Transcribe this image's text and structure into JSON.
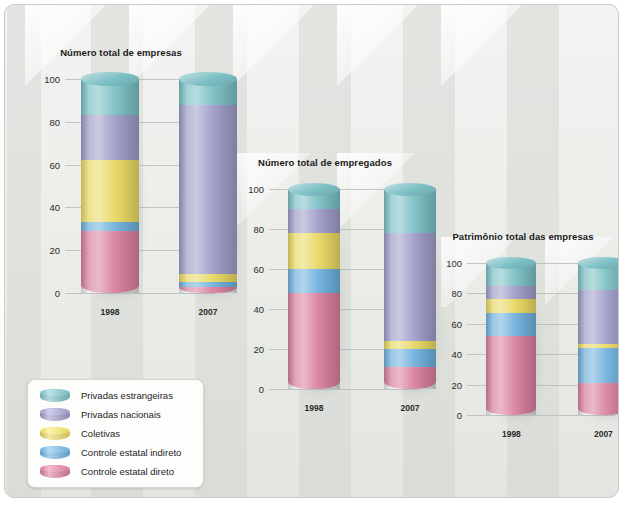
{
  "figure": {
    "background_color": "#ecEEea",
    "frame_color": "#c9cbc8"
  },
  "legend": {
    "items": [
      {
        "label": "Privadas estrangeiras",
        "key": "privadas_estrangeiras",
        "color": "#7bbfc4"
      },
      {
        "label": "Privadas nacionais",
        "key": "privadas_nacionais",
        "color": "#9e9cc8"
      },
      {
        "label": "Coletivas",
        "key": "coletivas",
        "color": "#e8d862"
      },
      {
        "label": "Controle estatal indireto",
        "key": "controle_estatal_indireto",
        "color": "#6fb0dc"
      },
      {
        "label": "Controle estatal direto",
        "key": "controle_estatal_direto",
        "color": "#d87f9f"
      }
    ]
  },
  "chart_data": [
    {
      "id": "empresas",
      "type": "bar",
      "stacked": true,
      "title": "Número total de empresas",
      "xlabel": "",
      "ylabel": "",
      "categories": [
        "1998",
        "2007"
      ],
      "yticks": [
        0,
        20,
        40,
        60,
        80,
        100
      ],
      "ylim": [
        0,
        100
      ],
      "grid": true,
      "legend_position": "bottom-left-external",
      "unit": "%",
      "series": [
        {
          "name": "Controle estatal direto",
          "color": "#d87f9f",
          "values": [
            29,
            3
          ]
        },
        {
          "name": "Controle estatal indireto",
          "color": "#6fb0dc",
          "values": [
            4,
            2
          ]
        },
        {
          "name": "Coletivas",
          "color": "#e8d862",
          "values": [
            29,
            4
          ]
        },
        {
          "name": "Privadas nacionais",
          "color": "#9e9cc8",
          "values": [
            21,
            79
          ]
        },
        {
          "name": "Privadas estrangeiras",
          "color": "#7bbfc4",
          "values": [
            17,
            12
          ]
        }
      ]
    },
    {
      "id": "empregados",
      "type": "bar",
      "stacked": true,
      "title": "Número total de empregados",
      "xlabel": "",
      "ylabel": "",
      "categories": [
        "1998",
        "2007"
      ],
      "yticks": [
        0,
        20,
        40,
        60,
        80,
        100
      ],
      "ylim": [
        0,
        100
      ],
      "grid": true,
      "unit": "%",
      "series": [
        {
          "name": "Controle estatal direto",
          "color": "#d87f9f",
          "values": [
            48,
            11
          ]
        },
        {
          "name": "Controle estatal indireto",
          "color": "#6fb0dc",
          "values": [
            12,
            9
          ]
        },
        {
          "name": "Coletivas",
          "color": "#e8d862",
          "values": [
            18,
            4
          ]
        },
        {
          "name": "Privadas nacionais",
          "color": "#9e9cc8",
          "values": [
            12,
            54
          ]
        },
        {
          "name": "Privadas estrangeiras",
          "color": "#7bbfc4",
          "values": [
            10,
            22
          ]
        }
      ]
    },
    {
      "id": "patrimonio",
      "type": "bar",
      "stacked": true,
      "title": "Patrimônio total das empresas",
      "xlabel": "",
      "ylabel": "",
      "categories": [
        "1998",
        "2007"
      ],
      "yticks": [
        0,
        20,
        40,
        60,
        80,
        100
      ],
      "ylim": [
        0,
        100
      ],
      "grid": true,
      "unit": "%",
      "series": [
        {
          "name": "Controle estatal direto",
          "color": "#d87f9f",
          "values": [
            52,
            21
          ]
        },
        {
          "name": "Controle estatal indireto",
          "color": "#6fb0dc",
          "values": [
            15,
            23
          ]
        },
        {
          "name": "Coletivas",
          "color": "#e8d862",
          "values": [
            9,
            3
          ]
        },
        {
          "name": "Privadas nacionais",
          "color": "#9e9cc8",
          "values": [
            9,
            35
          ]
        },
        {
          "name": "Privadas estrangeiras",
          "color": "#7bbfc4",
          "values": [
            15,
            18
          ]
        }
      ]
    }
  ]
}
